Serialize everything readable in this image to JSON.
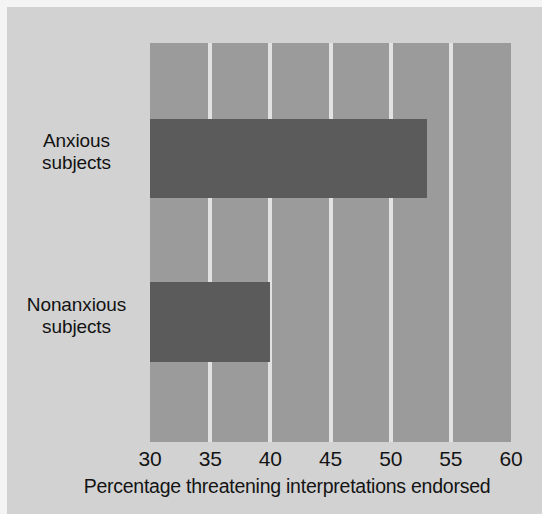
{
  "chart_data": {
    "type": "bar",
    "orientation": "horizontal",
    "title": "",
    "subtitle": "",
    "xlabel": "Percentage threatening interpretations endorsed",
    "ylabel": "",
    "categories": [
      "Anxious subjects",
      "Nonanxious subjects"
    ],
    "category_lines": [
      [
        "Anxious",
        "subjects"
      ],
      [
        "Nonanxious",
        "subjects"
      ]
    ],
    "values": [
      53,
      40
    ],
    "xlim": [
      30,
      60
    ],
    "xticks": [
      30,
      35,
      40,
      45,
      50,
      55,
      60
    ],
    "xtick_labels": [
      "30",
      "35",
      "40",
      "45",
      "50",
      "55",
      "60"
    ],
    "gridlines_x": [
      35,
      40,
      45,
      50,
      55
    ],
    "grid": true,
    "legend": false,
    "legend_position": "none",
    "series": [
      {
        "name": "Percentage threatening interpretations endorsed",
        "values": [
          53,
          40
        ]
      }
    ],
    "bar_baseline": 30,
    "annotations": []
  },
  "colors": {
    "figure_background": "#f4f4f4",
    "panel_background": "#d2d2d2",
    "plot_background": "#9b9b9b",
    "bar_fill": "#5b5b5b",
    "gridline": "#e8e8e8",
    "text": "#141414"
  }
}
